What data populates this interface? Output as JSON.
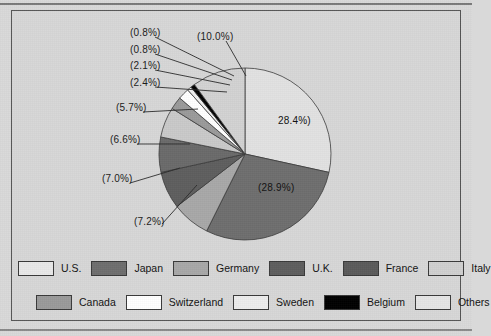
{
  "chart_data": {
    "type": "pie",
    "title": "",
    "subtitle": "",
    "xlabel": "",
    "ylabel": "",
    "legend_position": "bottom",
    "grid": false,
    "start_angle_deg": 0,
    "direction": "clockwise",
    "categories": [
      "U.S.",
      "Japan",
      "Germany",
      "U.K.",
      "France",
      "Italy",
      "Canada",
      "Switzerland",
      "Sweden",
      "Belgium",
      "Others"
    ],
    "values": [
      28.4,
      28.9,
      7.2,
      7.0,
      6.6,
      5.7,
      2.4,
      2.1,
      0.8,
      0.8,
      10.0
    ],
    "unit": "%",
    "slice_colors": [
      "#e2e2e2",
      "#6e6e6e",
      "#a8a8a8",
      "#5e5e5e",
      "#6a6a6a",
      "#c9c9c9",
      "#9a9a9a",
      "#ffffff",
      "#efefef",
      "#000000",
      "#d2d2d2"
    ],
    "annotations": [
      {
        "id": "lbl-us",
        "text": "28.4%)",
        "placement": "inside"
      },
      {
        "id": "lbl-japan",
        "text": "(28.9%)",
        "placement": "inside"
      },
      {
        "id": "lbl-germany",
        "text": "(7.2%)",
        "placement": "leader"
      },
      {
        "id": "lbl-uk",
        "text": "(7.0%)",
        "placement": "leader"
      },
      {
        "id": "lbl-france",
        "text": "(6.6%)",
        "placement": "leader"
      },
      {
        "id": "lbl-italy",
        "text": "(5.7%)",
        "placement": "leader"
      },
      {
        "id": "lbl-canada",
        "text": "(2.4%)",
        "placement": "leader"
      },
      {
        "id": "lbl-switzerland",
        "text": "(2.1%)",
        "placement": "leader"
      },
      {
        "id": "lbl-sweden",
        "text": "(0.8%)",
        "placement": "leader"
      },
      {
        "id": "lbl-belgium",
        "text": "(0.8%)",
        "placement": "leader"
      },
      {
        "id": "lbl-others",
        "text": "(10.0%)",
        "placement": "leader"
      }
    ]
  },
  "labels": {
    "us": "28.4%)",
    "japan": "(28.9%)",
    "germany": "(7.2%)",
    "uk": "(7.0%)",
    "france": "(6.6%)",
    "italy": "(5.7%)",
    "canada": "(2.4%)",
    "switzerland": "(2.1%)",
    "sweden": "(0.8%)",
    "belgium": "(0.8%)",
    "others": "(10.0%)"
  },
  "legend": {
    "row1": [
      {
        "label": "U.S.",
        "color": "#e9e9e9"
      },
      {
        "label": "Japan",
        "color": "#6e6e6e"
      },
      {
        "label": "Germany",
        "color": "#a8a8a8"
      },
      {
        "label": "U.K.",
        "color": "#5e5e5e"
      },
      {
        "label": "France",
        "color": "#5a5a5a"
      },
      {
        "label": "Italy",
        "color": "#cfcfcf"
      }
    ],
    "row2": [
      {
        "label": "Canada",
        "color": "#9a9a9a"
      },
      {
        "label": "Switzerland",
        "color": "#ffffff"
      },
      {
        "label": "Sweden",
        "color": "#ededed"
      },
      {
        "label": "Belgium",
        "color": "#000000"
      },
      {
        "label": "Others",
        "color": "#e6e6e6"
      }
    ]
  }
}
